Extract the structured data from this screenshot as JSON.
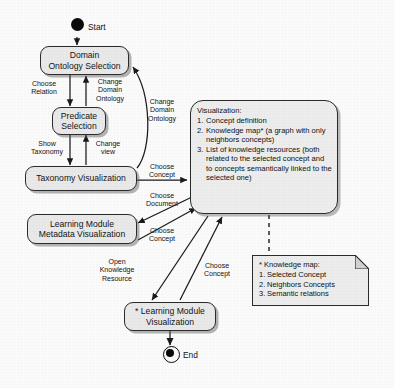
{
  "diagram": {
    "background_color": "#fbfbfb",
    "node_fill_color": "#e9e9e9",
    "stroke_color": "#2b2b2b"
  },
  "terminals": {
    "start_label": "Start",
    "end_label": "End"
  },
  "nodes": {
    "domain_ontology_selection": "Domain\nOntology Selection",
    "predicate_selection": "Predicate\nSelection",
    "taxonomy_visualization": "Taxonomy Visualization",
    "learning_module_metadata": "Learning Module\nMetadata Visualization",
    "learning_module_visualization": "* Learning Module\nVisualization"
  },
  "visualization_box": {
    "title": "Visualization:",
    "items": [
      {
        "num": "1.",
        "text": "Concept definition"
      },
      {
        "num": "2.",
        "text": "Knowledge map* (a graph with only neighbors concepts)"
      },
      {
        "num": "3.",
        "text": "List of knowledge resources (both related to the selected concept and to concepts semantically linked to the selected one)"
      }
    ]
  },
  "note_box": {
    "title": "* Knowledge map:",
    "items": [
      {
        "num": "1.",
        "text": "Selected Concept"
      },
      {
        "num": "2.",
        "text": "Neighbors Concepts"
      },
      {
        "num": "3.",
        "text": "Semantic relations"
      }
    ]
  },
  "edge_labels": {
    "choose_relation": "Choose\nRelation",
    "change_domain_ontology_inner": "Change\nDomain\nOntology",
    "change_domain_ontology_outer": "Change\nDomain\nOntology",
    "show_taxonomy": "Show\nTaxonomy",
    "change_view": "Change\nview",
    "choose_concept_taxonomy": "Choose\nConcept",
    "choose_document": "Choose\nDocument",
    "choose_concept_metadata": "Choose\nConcept",
    "open_knowledge_resource": "Open\nKnowledge\nResource",
    "choose_concept_module": "Choose\nConcept"
  }
}
